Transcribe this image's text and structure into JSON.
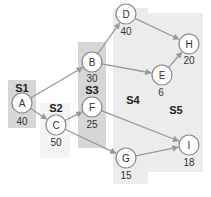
{
  "colors": {
    "background": "#ffffff",
    "stage_dark": "#d6d6d6",
    "stage_light": "#ececec",
    "stage_faint": "#f4f4f4",
    "node_fill": "#ffffff",
    "node_stroke": "#888888",
    "edge": "#999999",
    "text": "#333333"
  },
  "stages": [
    {
      "id": "S1",
      "label": "S1",
      "x": 8,
      "y": 80,
      "w": 28,
      "h": 48,
      "shade": "stage_dark",
      "label_x": 22,
      "label_y": 92
    },
    {
      "id": "S2",
      "label": "S2",
      "x": 40,
      "y": 103,
      "w": 30,
      "h": 55,
      "shade": "stage_faint",
      "label_x": 56,
      "label_y": 112
    },
    {
      "id": "S3",
      "label": "S3",
      "x": 78,
      "y": 42,
      "w": 28,
      "h": 106,
      "shade": "stage_dark",
      "label_x": 92,
      "label_y": 94
    },
    {
      "id": "S4",
      "label": "S4",
      "x": 113,
      "y": 8,
      "w": 35,
      "h": 176,
      "shade": "stage_light",
      "label_x": 133,
      "label_y": 104
    },
    {
      "id": "S5",
      "label": "S5",
      "x": 148,
      "y": 13,
      "w": 55,
      "h": 159,
      "shade": "stage_light",
      "label_x": 176,
      "label_y": 114
    }
  ],
  "nodes": [
    {
      "id": "A",
      "label": "A",
      "value": "40",
      "cx": 22,
      "cy": 103,
      "vx": 22,
      "vy": 125
    },
    {
      "id": "C",
      "label": "C",
      "value": "50",
      "cx": 56,
      "cy": 125,
      "vx": 56,
      "vy": 146
    },
    {
      "id": "B",
      "label": "B",
      "value": "30",
      "cx": 92,
      "cy": 62,
      "vx": 92,
      "vy": 82
    },
    {
      "id": "F",
      "label": "F",
      "value": "25",
      "cx": 92,
      "cy": 107,
      "vx": 92,
      "vy": 128
    },
    {
      "id": "D",
      "label": "D",
      "value": "40",
      "cx": 126,
      "cy": 14,
      "vx": 126,
      "vy": 35
    },
    {
      "id": "G",
      "label": "G",
      "value": "15",
      "cx": 126,
      "cy": 158,
      "vx": 126,
      "vy": 179
    },
    {
      "id": "E",
      "label": "E",
      "value": "6",
      "cx": 162,
      "cy": 75,
      "vx": 161,
      "vy": 96
    },
    {
      "id": "H",
      "label": "H",
      "value": "20",
      "cx": 189,
      "cy": 44,
      "vx": 189,
      "vy": 64
    },
    {
      "id": "I",
      "label": "I",
      "value": "18",
      "cx": 189,
      "cy": 145,
      "vx": 189,
      "vy": 166
    }
  ],
  "edges": [
    {
      "from": "A",
      "to": "B"
    },
    {
      "from": "A",
      "to": "C"
    },
    {
      "from": "C",
      "to": "F"
    },
    {
      "from": "C",
      "to": "G"
    },
    {
      "from": "B",
      "to": "D"
    },
    {
      "from": "B",
      "to": "E"
    },
    {
      "from": "D",
      "to": "H"
    },
    {
      "from": "E",
      "to": "H"
    },
    {
      "from": "F",
      "to": "I"
    },
    {
      "from": "G",
      "to": "I"
    }
  ],
  "node_radius": 10
}
